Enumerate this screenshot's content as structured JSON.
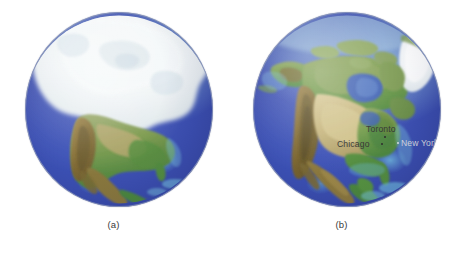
{
  "figure": {
    "background_color": "#ffffff",
    "width": 455,
    "height": 258
  },
  "panels": [
    {
      "id": "panel-a",
      "caption": "(a)",
      "description": "Globe showing North America covered by a continental ice sheet",
      "has_ice_sheet": true,
      "cities": []
    },
    {
      "id": "panel-b",
      "caption": "(b)",
      "description": "Globe showing present-day North America with cities labeled",
      "has_ice_sheet": false,
      "cities": [
        {
          "name": "Chicago",
          "style": "dark",
          "left": 84,
          "top": 128,
          "dot_left": 128,
          "dot_top": 131
        },
        {
          "name": "Toronto",
          "style": "dark",
          "left": 113,
          "top": 113,
          "dot_left": 131,
          "dot_top": 124
        },
        {
          "name": "New York",
          "style": "light",
          "left": 147,
          "top": 127,
          "dot_left": 144,
          "dot_top": 130
        }
      ]
    }
  ],
  "colors": {
    "ocean_deep": "#3c4fb2",
    "ocean_mid": "#4a5fc0",
    "ocean_shelf": "#78c6e4",
    "ice": "#e9eef2",
    "land_green": "#6f9a4a",
    "land_tan": "#c9b882",
    "land_brown": "#8a7240",
    "caption_text": "#3a3a3a",
    "label_dark": "#31312f",
    "label_light": "#d9dce2"
  }
}
